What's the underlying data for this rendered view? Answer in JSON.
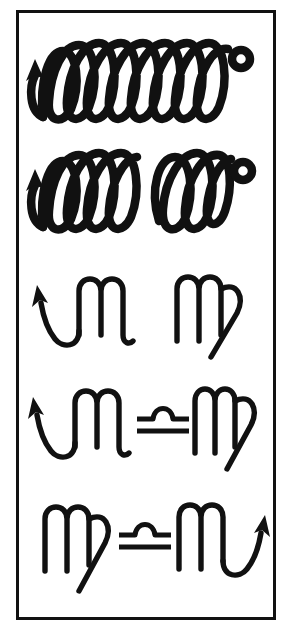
{
  "figure": {
    "background_color": "#ffffff",
    "ink_color": "#111111",
    "border_color": "#111111",
    "border_width_px": 3,
    "row_count": 5
  },
  "rows": [
    {
      "index": 1,
      "name": "continuous-loop-spiral",
      "description": "A single unbroken chain of seven tall vertical loops drawn with a thick pen, beginning with an upward arrowhead at the left and finishing with a small closed circle at the right.",
      "stroke_weight": "thick",
      "loop_count": 7,
      "groups": 1,
      "has_start_arrow": true,
      "arrow_side": "left",
      "has_end_circle": true
    },
    {
      "index": 2,
      "name": "broken-loop-spiral",
      "description": "The same loop chain but interrupted in the middle: a left group of four loops starting with an upward arrowhead, a blank gap, then a right group of three loops ending in a small closed circle.",
      "stroke_weight": "thick",
      "loop_count": 7,
      "groups": 2,
      "left_group_loops": 4,
      "right_group_loops": 3,
      "has_start_arrow": true,
      "arrow_side": "left",
      "has_end_circle": true,
      "has_gap": true
    },
    {
      "index": 3,
      "name": "scorpio-virgo-pair",
      "description": "Two thin-stroked glyphs side by side with no connector: the Scorpio symbol on the left with its arrow tail sweeping up to the left, and the Virgo symbol on the right with its crossed descending tail.",
      "stroke_weight": "thin",
      "left_glyph": "scorpio-arrow-left",
      "right_glyph": "virgo",
      "connector": null
    },
    {
      "index": 4,
      "name": "scorpio-libra-virgo",
      "description": "Scorpio with a left-sweeping arrow tail, the Libra symbol as a central connector, and Virgo with its crossed descending tail on the right.",
      "stroke_weight": "thin",
      "left_glyph": "scorpio-arrow-left",
      "right_glyph": "virgo",
      "connector": "libra"
    },
    {
      "index": 5,
      "name": "virgo-libra-scorpio",
      "description": "The mirrored arrangement: Virgo with its crossed descending tail on the left, the Libra symbol as the central connector, and Scorpio on the right with its arrow tail sweeping up to the right.",
      "stroke_weight": "thin",
      "left_glyph": "virgo",
      "right_glyph": "scorpio-arrow-right",
      "connector": "libra"
    }
  ],
  "glyphs": {
    "scorpio_arrow_left": {
      "label": "Scorpio (arrow at left)",
      "unicode": "♏",
      "name": "scorpio-glyph"
    },
    "scorpio_arrow_right": {
      "label": "Scorpio (arrow at right)",
      "unicode": "♏",
      "name": "scorpio-glyph"
    },
    "virgo": {
      "label": "Virgo",
      "unicode": "♍",
      "name": "virgo-glyph"
    },
    "libra": {
      "label": "Libra",
      "unicode": "♎",
      "name": "libra-glyph"
    },
    "loop_chain": {
      "label": "Looping pen stroke chain",
      "name": "loop-chain"
    }
  }
}
